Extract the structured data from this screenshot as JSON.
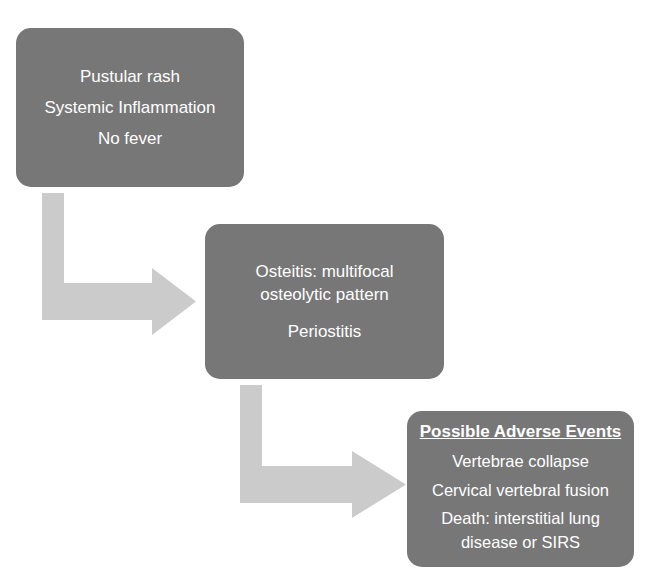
{
  "diagram": {
    "background_color": "#ffffff",
    "node_fill_color": "#777777",
    "node_text_color": "#ffffff",
    "arrow_color": "#cbcbcb",
    "nodes": [
      {
        "id": "symptoms",
        "lines": [
          "Pustular rash",
          "Systemic Inflammation",
          "No fever"
        ]
      },
      {
        "id": "osteitis",
        "lines": [
          "Osteitis: multifocal",
          "osteolytic pattern",
          "Periostitis"
        ]
      },
      {
        "id": "adverse",
        "title": "Possible Adverse Events",
        "lines": [
          "Vertebrae collapse",
          "Cervical vertebral fusion",
          "Death: interstitial lung",
          "disease or SIRS"
        ]
      }
    ],
    "arrows": [
      {
        "id": "arrow-symptoms-to-osteitis",
        "shape": "elbow-down-right"
      },
      {
        "id": "arrow-osteitis-to-adverse",
        "shape": "elbow-down-right"
      }
    ]
  }
}
